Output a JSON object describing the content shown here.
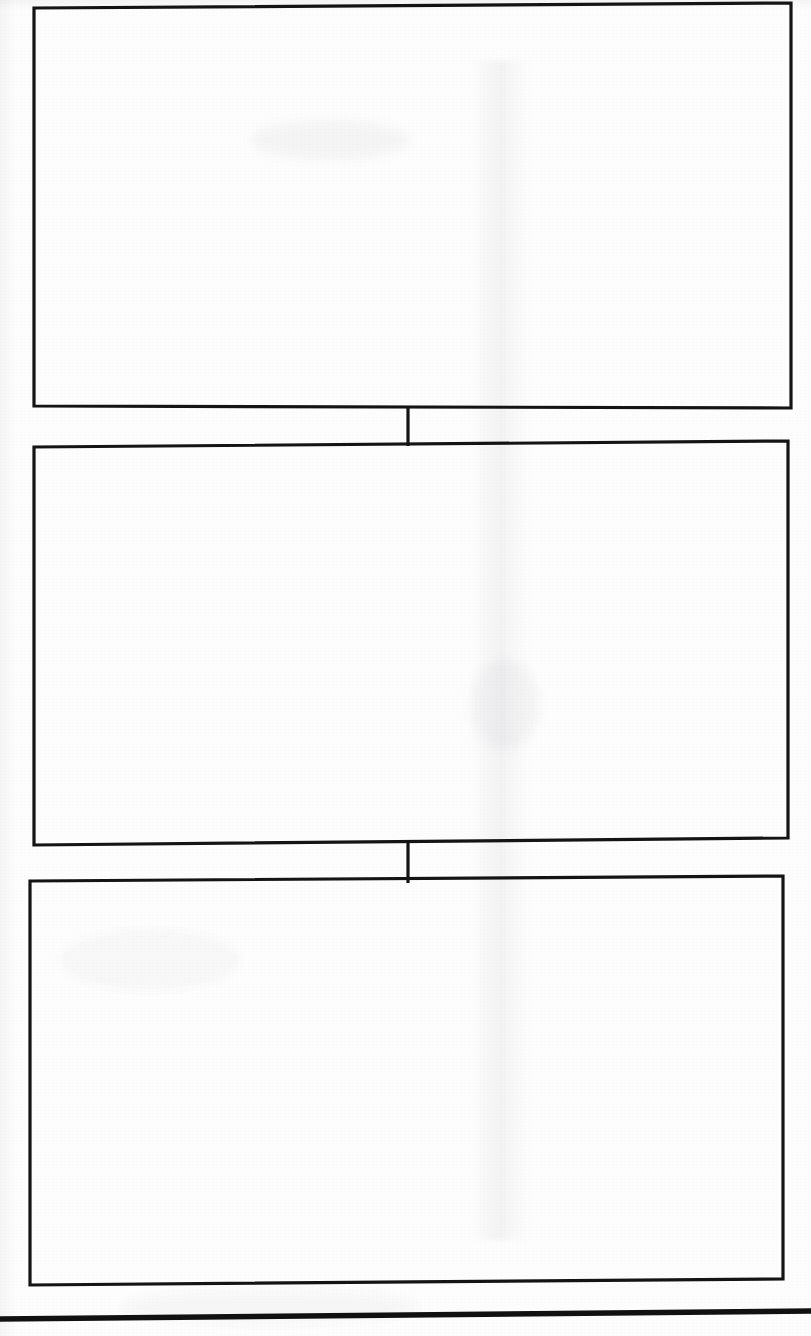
{
  "document": {
    "kind": "scanned-page",
    "page_width": 811,
    "page_height": 1336,
    "background_color": "#fdfdfd",
    "ink_color": "#141414"
  },
  "diagram": {
    "type": "flowchart",
    "orientation": "vertical",
    "node_count": 3,
    "connector_count": 2,
    "nodes": [
      {
        "id": "box-1",
        "label": "",
        "order": 1,
        "x": 33,
        "y": 7,
        "width": 758,
        "height": 401
      },
      {
        "id": "box-2",
        "label": "",
        "order": 2,
        "x": 33,
        "y": 444,
        "width": 754,
        "height": 399
      },
      {
        "id": "box-3",
        "label": "",
        "order": 3,
        "x": 29,
        "y": 879,
        "width": 753,
        "height": 404
      }
    ],
    "connectors": [
      {
        "id": "connector-1",
        "from": "box-1",
        "to": "box-2",
        "x": 408,
        "y_start": 408,
        "y_end": 444
      },
      {
        "id": "connector-2",
        "from": "box-2",
        "to": "box-3",
        "x": 408,
        "y_start": 843,
        "y_end": 881
      }
    ]
  },
  "footer": {
    "rule_label": "",
    "y": 1316,
    "thickness": 5
  }
}
